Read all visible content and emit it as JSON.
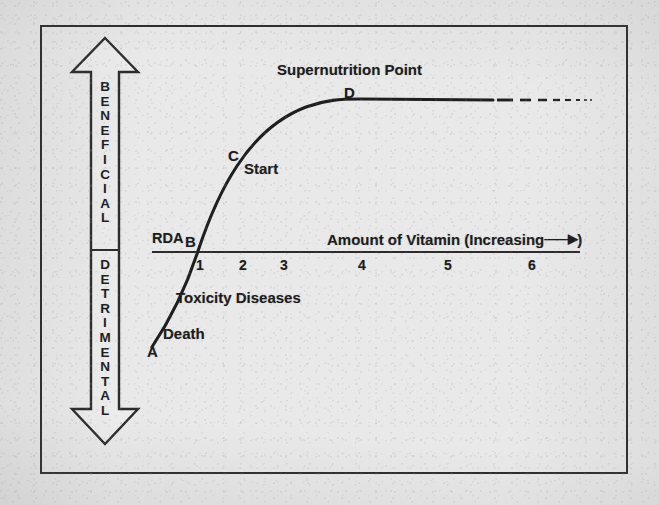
{
  "figure": {
    "type": "annotated-line-diagram",
    "background_color": "#e9e9e9",
    "ink_color": "#1c1c1c"
  },
  "vertical_axis": {
    "name": "benefit-detriment-axis",
    "style": "double-headed hollow block arrow",
    "upper_label": "BENEFICIAL",
    "lower_label": "DETRIMENTAL",
    "upper_direction": "up",
    "lower_direction": "down"
  },
  "horizontal_axis": {
    "name": "amount-of-vitamin-axis",
    "label": "Amount of Vitamin  (Increasing",
    "label_suffix": ")",
    "arrow_glyph": "——▶",
    "ticks": [
      "1",
      "2",
      "3",
      "4",
      "5",
      "6"
    ],
    "rda_label": "RDA"
  },
  "points": [
    {
      "id": "A",
      "label": "A",
      "note": "Death / severe deficiency, far below RDA"
    },
    {
      "id": "B",
      "label": "B",
      "note": "RDA level, curve crosses baseline"
    },
    {
      "id": "C",
      "label": "C",
      "note": "Start of supplementation"
    },
    {
      "id": "D",
      "label": "D",
      "note": "Supernutrition Point, plateau begins"
    }
  ],
  "annotations": {
    "supernutrition_point": "Supernutrition Point",
    "start": "Start",
    "toxicity_diseases": "Toxicity Diseases",
    "death": "Death"
  },
  "chart_data": {
    "type": "line",
    "title": "Supernutrition Point",
    "xlabel": "Amount of Vitamin  (Increasing ——▶)",
    "ylabel": "BENEFICIAL / DETRIMENTAL",
    "xticks": [
      1,
      2,
      3,
      4,
      5,
      6
    ],
    "xlim": [
      0,
      6.6
    ],
    "grid": false,
    "legend": false,
    "series": [
      {
        "name": "health-response-curve",
        "shape": "sigmoid",
        "x": [
          0.55,
          0.75,
          1.0,
          1.3,
          1.6,
          2.0,
          2.4,
          2.8,
          3.2,
          3.6,
          4.0,
          4.6,
          5.2,
          5.6,
          6.2
        ],
        "y": [
          -2.4,
          -1.6,
          0.0,
          1.4,
          2.4,
          3.4,
          4.1,
          4.6,
          4.9,
          5.05,
          5.1,
          5.1,
          5.1,
          5.1,
          5.1
        ],
        "dashed_from_x": 4.7
      }
    ],
    "labeled_points": [
      {
        "label": "A",
        "x": 0.55,
        "y": -2.4,
        "text": "Death"
      },
      {
        "label": "B",
        "x": 1.0,
        "y": 0.0,
        "text": "RDA"
      },
      {
        "label": "C",
        "x": 1.62,
        "y": 2.45,
        "text": "Start"
      },
      {
        "label": "D",
        "x": 3.35,
        "y": 5.0,
        "text": "Supernutrition Point"
      }
    ],
    "region_labels": [
      "Toxicity Diseases"
    ]
  }
}
